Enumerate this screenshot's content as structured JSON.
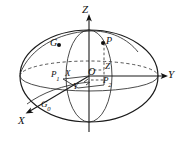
{
  "figure": {
    "kind": "3d-sphere-coordinate-diagram",
    "background_color": "#ffffff",
    "ink_color": "#111111",
    "width": 179,
    "height": 143,
    "axes": {
      "z_label": "Z",
      "y_label": "Y",
      "x_label": "X",
      "origin_label": "O"
    },
    "points": {
      "p_label": "P",
      "g_label": "G",
      "g0_label_base": "G",
      "g0_label_sub": "0",
      "p1_label_base": "P",
      "p1_label_sub": "1",
      "p2_label_base": "P",
      "p2_label_sub": "2",
      "px_label": "X",
      "py_label": "Y",
      "pz_label": "Z"
    }
  }
}
